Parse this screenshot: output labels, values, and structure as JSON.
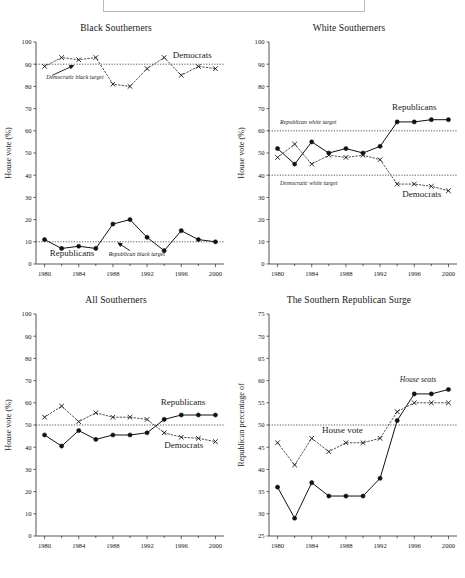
{
  "figure": {
    "top_box_present": true,
    "caption_partial": "",
    "x_tick_labels": [
      "1980",
      "1984",
      "1988",
      "1992",
      "1996",
      "2000"
    ],
    "x_major_ticks": [
      1980,
      1984,
      1988,
      1992,
      1996,
      2000
    ],
    "x_minor_ticks": [
      1982,
      1986,
      1990,
      1994,
      1998
    ],
    "xlim": [
      1979,
      2001
    ]
  },
  "chart_data": [
    {
      "id": "black-southerners",
      "type": "line",
      "title": "Black Southerners",
      "xlabel": "",
      "ylabel": "House vote (%)",
      "xlim": [
        1979,
        2001
      ],
      "ylim": [
        0,
        100
      ],
      "yticks": [
        0,
        10,
        20,
        30,
        40,
        50,
        60,
        70,
        80,
        90,
        100
      ],
      "grid": false,
      "legend_position": "inline",
      "x": [
        1980,
        1982,
        1984,
        1986,
        1988,
        1990,
        1992,
        1994,
        1996,
        1998,
        2000
      ],
      "series": [
        {
          "name": "Democrats",
          "marker": "x",
          "style": "dotted",
          "label_x": 1995.0,
          "label_y": 93.0,
          "values": [
            89,
            93,
            92,
            93,
            81,
            80,
            88,
            93,
            85,
            89,
            88
          ]
        },
        {
          "name": "Republicans",
          "marker": "dot",
          "style": "solid",
          "label_x": 1980.6,
          "label_y": 3.5,
          "values": [
            11,
            7,
            8,
            7,
            18,
            20,
            12,
            6,
            15,
            11,
            10
          ]
        }
      ],
      "reference_lines": [
        {
          "label": "Democratic black target",
          "value": 90,
          "label_x": 1980.2,
          "label_y": 83.5,
          "arrow_from_x": 1980.9,
          "arrow_from_y": 85.0,
          "arrow_to_x": 1983.4,
          "arrow_to_y": 89.4
        },
        {
          "label": "Republican black target",
          "value": 10,
          "label_x": 1987.5,
          "label_y": 3.5,
          "arrow_from_x": 1990.0,
          "arrow_from_y": 6.0,
          "arrow_to_x": 1988.6,
          "arrow_to_y": 9.5
        }
      ]
    },
    {
      "id": "white-southerners",
      "type": "line",
      "title": "White Southerners",
      "xlabel": "",
      "ylabel": "House vote (%)",
      "xlim": [
        1979,
        2001
      ],
      "ylim": [
        0,
        100
      ],
      "yticks": [
        0,
        10,
        20,
        30,
        40,
        50,
        60,
        70,
        80,
        90,
        100
      ],
      "grid": false,
      "legend_position": "inline",
      "x": [
        1980,
        1982,
        1984,
        1986,
        1988,
        1990,
        1992,
        1994,
        1996,
        1998,
        2000
      ],
      "series": [
        {
          "name": "Republicans",
          "marker": "dot",
          "style": "solid",
          "label_x": 1993.4,
          "label_y": 69.5,
          "values": [
            52,
            45,
            55,
            50,
            52,
            50,
            53,
            64,
            64,
            65,
            65
          ]
        },
        {
          "name": "Democrats",
          "marker": "x",
          "style": "dotted",
          "label_x": 1994.6,
          "label_y": 30.0,
          "values": [
            48,
            54,
            45,
            49,
            48,
            49,
            47,
            36,
            36,
            35,
            33
          ]
        }
      ],
      "reference_lines": [
        {
          "label": "Republican white target",
          "value": 60,
          "label_x": 1980.3,
          "label_y": 63.0,
          "arrow_from_x": null,
          "arrow_from_y": null,
          "arrow_to_x": null,
          "arrow_to_y": null
        },
        {
          "label": "Democratic white target",
          "value": 40,
          "label_x": 1980.3,
          "label_y": 35.5,
          "arrow_from_x": null,
          "arrow_from_y": null,
          "arrow_to_x": null,
          "arrow_to_y": null
        }
      ]
    },
    {
      "id": "all-southerners",
      "type": "line",
      "title": "All Southerners",
      "xlabel": "",
      "ylabel": "House vote (%)",
      "xlim": [
        1979,
        2001
      ],
      "ylim": [
        0,
        100
      ],
      "yticks": [
        0,
        10,
        20,
        30,
        40,
        50,
        60,
        70,
        80,
        90,
        100
      ],
      "grid": false,
      "legend_position": "inline",
      "x": [
        1980,
        1982,
        1984,
        1986,
        1988,
        1990,
        1992,
        1994,
        1996,
        1998,
        2000
      ],
      "series": [
        {
          "name": "Republicans",
          "marker": "dot",
          "style": "solid",
          "label_x": 1993.6,
          "label_y": 59.0,
          "values": [
            45.5,
            40.5,
            47.5,
            43.5,
            45.5,
            45.5,
            46.5,
            52.5,
            54.5,
            54.5,
            54.5
          ]
        },
        {
          "name": "Democrats",
          "marker": "x",
          "style": "dotted",
          "label_x": 1994.0,
          "label_y": 39.5,
          "values": [
            53.5,
            58.5,
            51.5,
            55.5,
            53.5,
            53.5,
            52.5,
            46.5,
            44.5,
            44.0,
            42.5
          ]
        }
      ],
      "reference_lines": [
        {
          "label": "",
          "value": 50,
          "label_x": null,
          "label_y": null,
          "arrow_from_x": null,
          "arrow_from_y": null,
          "arrow_to_x": null,
          "arrow_to_y": null
        }
      ]
    },
    {
      "id": "southern-republican-surge",
      "type": "line",
      "title": "The Southern Republican Surge",
      "xlabel": "",
      "ylabel": "Republican percentage of",
      "xlim": [
        1979,
        2001
      ],
      "ylim": [
        25,
        75
      ],
      "yticks": [
        25,
        30,
        35,
        40,
        45,
        50,
        55,
        60,
        65,
        70,
        75
      ],
      "grid": false,
      "legend_position": "inline",
      "x": [
        1980,
        1982,
        1984,
        1986,
        1988,
        1990,
        1992,
        1994,
        1996,
        1998,
        2000
      ],
      "series": [
        {
          "name": "House seats",
          "marker": "dot",
          "style": "solid",
          "label_x": 1994.3,
          "label_y": 59.6,
          "values": [
            36,
            29,
            37,
            34,
            34,
            34,
            38,
            51,
            57,
            57,
            58
          ]
        },
        {
          "name": "House vote",
          "marker": "x",
          "style": "dotted",
          "label_x": 1985.2,
          "label_y": 48.2,
          "values": [
            46,
            41,
            47,
            44,
            46,
            46,
            47,
            53,
            55,
            55,
            55
          ]
        }
      ],
      "reference_lines": [
        {
          "label": "",
          "value": 50,
          "label_x": null,
          "label_y": null,
          "arrow_from_x": null,
          "arrow_from_y": null,
          "arrow_to_x": null,
          "arrow_to_y": null
        }
      ]
    }
  ]
}
